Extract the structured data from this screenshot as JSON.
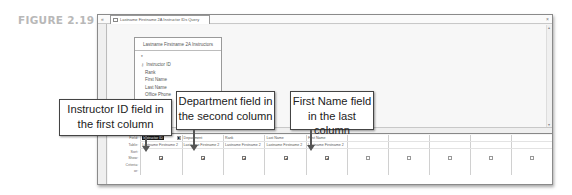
{
  "figure": {
    "label": "FIGURE 2.19"
  },
  "window": {
    "tab_title": "Lastname Firstname 2A Instructor IDs Query",
    "nav_toggle": "«",
    "close": "×",
    "navigation_pane_label": "Navigation Pane"
  },
  "field_list": {
    "title": "Lastname Firstname 2A Instructors",
    "fields": [
      {
        "name": "*",
        "key": false
      },
      {
        "name": "Instructor ID",
        "key": true
      },
      {
        "name": "Rank",
        "key": false
      },
      {
        "name": "First Name",
        "key": false
      },
      {
        "name": "Last Name",
        "key": false
      },
      {
        "name": "Office Phone",
        "key": false
      },
      {
        "name": "Department",
        "key": false
      },
      {
        "name": "Fellow Email",
        "key": false
      }
    ]
  },
  "grid": {
    "row_headers": [
      "Field:",
      "Table:",
      "Sort:",
      "Show:",
      "Criteria:",
      "or:"
    ],
    "columns": [
      {
        "field": "Instructor ID",
        "table": "Lastname Firstname 2",
        "show": true,
        "selected": true
      },
      {
        "field": "Department",
        "table": "Lastname Firstname 2",
        "show": true,
        "selected": false
      },
      {
        "field": "Rank",
        "table": "Lastname Firstname 2",
        "show": true,
        "selected": false
      },
      {
        "field": "Last Name",
        "table": "Lastname Firstname 2",
        "show": true,
        "selected": false
      },
      {
        "field": "First Name",
        "table": "Lastname Firstname 2",
        "show": true,
        "selected": false
      },
      {
        "field": "",
        "table": "",
        "show": false,
        "selected": false
      },
      {
        "field": "",
        "table": "",
        "show": false,
        "selected": false
      },
      {
        "field": "",
        "table": "",
        "show": false,
        "selected": false
      },
      {
        "field": "",
        "table": "",
        "show": false,
        "selected": false
      },
      {
        "field": "",
        "table": "",
        "show": false,
        "selected": false
      }
    ]
  },
  "callouts": [
    {
      "line1": "Instructor ID field in",
      "line2": "the first column"
    },
    {
      "line1": "Department field in",
      "line2": "the second column"
    },
    {
      "line1": "First Name field",
      "line2": "in the last column"
    }
  ],
  "icons": {
    "checked": "✔",
    "dropdown": "▾",
    "key": "⚷",
    "scroll_left": "◂",
    "scroll_right": "▸",
    "scroll_up": "▴",
    "scroll_down": "▾"
  }
}
